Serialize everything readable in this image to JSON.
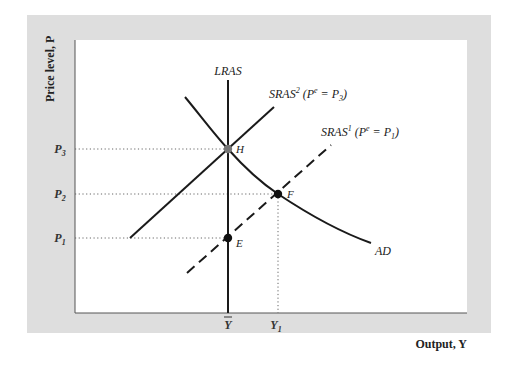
{
  "colors": {
    "panel": "#dedede",
    "plot_bg": "#ffffff",
    "axis": "#555555",
    "curve": "#1a1a1a",
    "guide": "#666666",
    "point_H": "#777777",
    "point_EF": "#111111"
  },
  "axes": {
    "y_label": "Price level, P",
    "x_label": "Output, Y",
    "y_ticks": [
      {
        "label": "P",
        "sub": "3",
        "y": 149
      },
      {
        "label": "P",
        "sub": "2",
        "y": 194
      },
      {
        "label": "P",
        "sub": "1",
        "y": 238
      }
    ],
    "x_ticks": [
      {
        "label": "Y",
        "overline": true,
        "sub": "",
        "x": 228
      },
      {
        "label": "Y",
        "overline": false,
        "sub": "1",
        "x": 278
      }
    ]
  },
  "curves": {
    "lras": {
      "label": "LRAS",
      "x": 228,
      "y_top": 80,
      "y_bottom": 313
    },
    "sras2": {
      "label": "SRAS",
      "sup": "2",
      "expect": "(P",
      "expect_sup": "e",
      "expect_rest": " = P",
      "expect_sub": "3",
      "close": ")",
      "style": "solid",
      "from": [
        130,
        238
      ],
      "to": [
        274,
        107
      ]
    },
    "sras1": {
      "label": "SRAS",
      "sup": "1",
      "expect": "(P",
      "expect_sup": "e",
      "expect_rest": " = P",
      "expect_sub": "1",
      "close": ")",
      "style": "dashed",
      "from": [
        187,
        273
      ],
      "to": [
        331,
        145
      ]
    },
    "ad": {
      "label": "AD",
      "points": [
        [
          185,
          97
        ],
        [
          228,
          149
        ],
        [
          278,
          194
        ],
        [
          371,
          243
        ]
      ]
    }
  },
  "points": [
    {
      "name": "H",
      "x": 228,
      "y": 149
    },
    {
      "name": "F",
      "x": 278,
      "y": 194
    },
    {
      "name": "E",
      "x": 228,
      "y": 238
    }
  ]
}
